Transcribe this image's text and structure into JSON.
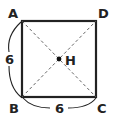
{
  "diagram": {
    "type": "geometry-square",
    "vertices": {
      "A": {
        "label": "A",
        "x": 22,
        "y": 21
      },
      "D": {
        "label": "D",
        "x": 96,
        "y": 21
      },
      "C": {
        "label": "C",
        "x": 96,
        "y": 97
      },
      "B": {
        "label": "B",
        "x": 22,
        "y": 97
      }
    },
    "center": {
      "label": "H",
      "x": 59,
      "y": 59
    },
    "side_labels": {
      "AB": "6",
      "BC": "6"
    },
    "colors": {
      "stroke": "#222222",
      "dashed": "#555555",
      "background": "#ffffff"
    }
  }
}
